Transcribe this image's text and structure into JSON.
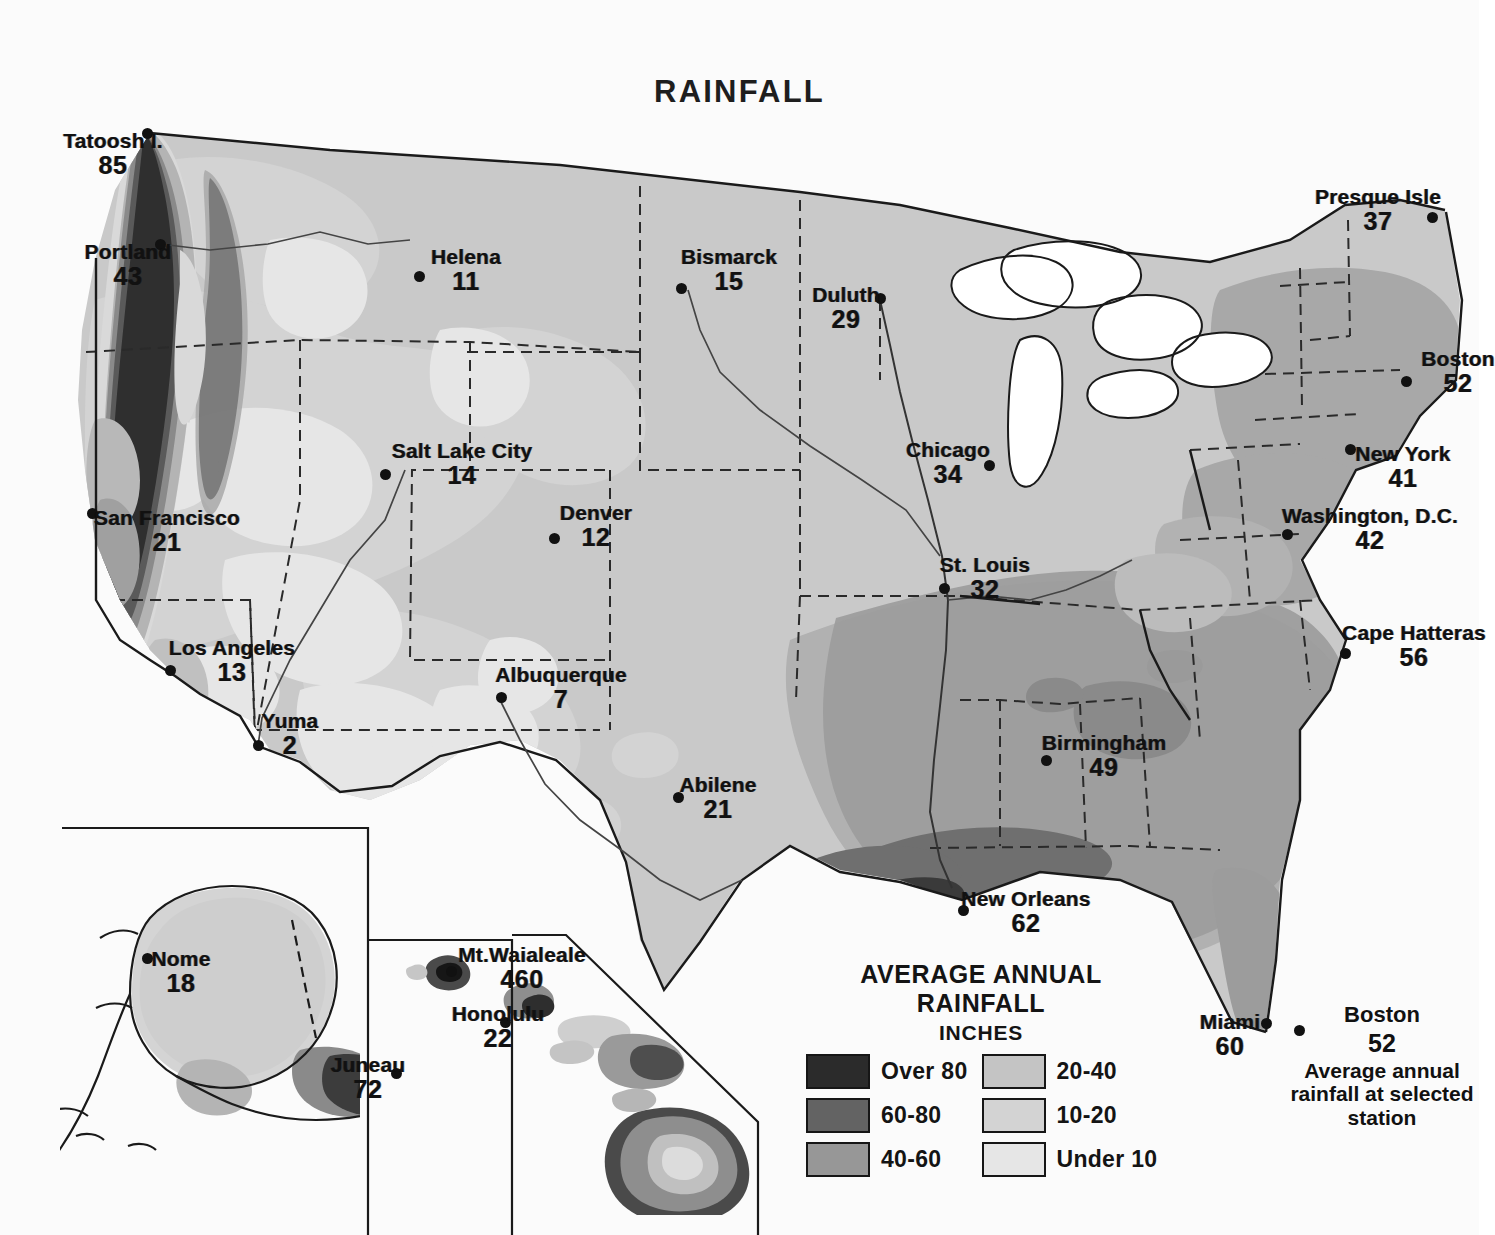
{
  "title": "RAINFALL",
  "map": {
    "name": "average-annual-rainfall-united-states",
    "land_tone": "#c9c9c9"
  },
  "legend": {
    "title": "AVERAGE ANNUAL RAINFALL",
    "subtitle": "INCHES",
    "items": [
      {
        "label": "Over 80",
        "color": "#2b2b2b"
      },
      {
        "label": "20-40",
        "color": "#c4c4c4"
      },
      {
        "label": "60-80",
        "color": "#636363"
      },
      {
        "label": "10-20",
        "color": "#d3d3d3"
      },
      {
        "label": "40-60",
        "color": "#979797"
      },
      {
        "label": "Under 10",
        "color": "#e6e6e6"
      }
    ]
  },
  "key_note": {
    "city": "Boston",
    "value": "52",
    "description": "Average annual rainfall at selected station"
  },
  "chart_data": {
    "type": "map",
    "title": "RAINFALL",
    "subtitle": "AVERAGE ANNUAL RAINFALL",
    "units": "INCHES",
    "measure": "average annual rainfall at selected station",
    "legend_bands": [
      {
        "label": "Over 80",
        "min": 80,
        "max": null,
        "color": "#2b2b2b"
      },
      {
        "label": "60-80",
        "min": 60,
        "max": 80,
        "color": "#636363"
      },
      {
        "label": "40-60",
        "min": 40,
        "max": 60,
        "color": "#979797"
      },
      {
        "label": "20-40",
        "min": 20,
        "max": 40,
        "color": "#c4c4c4"
      },
      {
        "label": "10-20",
        "min": 10,
        "max": 20,
        "color": "#d3d3d3"
      },
      {
        "label": "Under 10",
        "min": null,
        "max": 10,
        "color": "#e6e6e6"
      }
    ],
    "stations": [
      {
        "name": "Tatoosh I.",
        "value": 85,
        "x": 147,
        "y": 133,
        "lx": 113,
        "ly": 142,
        "align": "center"
      },
      {
        "name": "Portland",
        "value": 43,
        "x": 160,
        "y": 244,
        "lx": 128,
        "ly": 253,
        "align": "center"
      },
      {
        "name": "Helena",
        "value": 11,
        "x": 419,
        "y": 276,
        "lx": 466,
        "ly": 258,
        "align": "center"
      },
      {
        "name": "Bismarck",
        "value": 15,
        "x": 681,
        "y": 288,
        "lx": 729,
        "ly": 258,
        "align": "center"
      },
      {
        "name": "Duluth",
        "value": 29,
        "x": 880,
        "y": 298,
        "lx": 846,
        "ly": 296,
        "align": "center"
      },
      {
        "name": "Presque Isle",
        "value": 37,
        "x": 1432,
        "y": 217,
        "lx": 1378,
        "ly": 198,
        "align": "center"
      },
      {
        "name": "Boston",
        "value": 52,
        "x": 1406,
        "y": 381,
        "lx": 1458,
        "ly": 360,
        "align": "center"
      },
      {
        "name": "New York",
        "value": 41,
        "x": 1350,
        "y": 449,
        "lx": 1403,
        "ly": 455,
        "align": "center"
      },
      {
        "name": "Washington, D.C.",
        "value": 42,
        "x": 1287,
        "y": 534,
        "lx": 1370,
        "ly": 517,
        "align": "center"
      },
      {
        "name": "Cape Hatteras",
        "value": 56,
        "x": 1345,
        "y": 653,
        "lx": 1414,
        "ly": 634,
        "align": "center"
      },
      {
        "name": "Chicago",
        "value": 34,
        "x": 989,
        "y": 465,
        "lx": 948,
        "ly": 451,
        "align": "center"
      },
      {
        "name": "St. Louis",
        "value": 32,
        "x": 944,
        "y": 588,
        "lx": 985,
        "ly": 566,
        "align": "center"
      },
      {
        "name": "Salt Lake City",
        "value": 14,
        "x": 385,
        "y": 474,
        "lx": 462,
        "ly": 452,
        "align": "center"
      },
      {
        "name": "Denver",
        "value": 12,
        "x": 554,
        "y": 538,
        "lx": 596,
        "ly": 514,
        "align": "center"
      },
      {
        "name": "San Francisco",
        "value": 21,
        "x": 92,
        "y": 513,
        "lx": 167,
        "ly": 519,
        "align": "center"
      },
      {
        "name": "Los Angeles",
        "value": 13,
        "x": 170,
        "y": 670,
        "lx": 232,
        "ly": 649,
        "align": "center"
      },
      {
        "name": "Yuma",
        "value": 2,
        "x": 258,
        "y": 745,
        "lx": 290,
        "ly": 722,
        "align": "center"
      },
      {
        "name": "Albuquerque",
        "value": 7,
        "x": 501,
        "y": 697,
        "lx": 561,
        "ly": 676,
        "align": "center"
      },
      {
        "name": "Abilene",
        "value": 21,
        "x": 678,
        "y": 797,
        "lx": 718,
        "ly": 786,
        "align": "center"
      },
      {
        "name": "Birmingham",
        "value": 49,
        "x": 1046,
        "y": 760,
        "lx": 1104,
        "ly": 744,
        "align": "center"
      },
      {
        "name": "New Orleans",
        "value": 62,
        "x": 963,
        "y": 910,
        "lx": 1026,
        "ly": 900,
        "align": "center"
      },
      {
        "name": "Miami",
        "value": 60,
        "x": 1266,
        "y": 1023,
        "lx": 1230,
        "ly": 1023,
        "align": "center"
      },
      {
        "name": "Nome",
        "value": 18,
        "x": 147,
        "y": 958,
        "lx": 181,
        "ly": 960,
        "align": "center"
      },
      {
        "name": "Juneau",
        "value": 72,
        "x": 396,
        "y": 1073,
        "lx": 368,
        "ly": 1066,
        "align": "center"
      },
      {
        "name": "Mt.Waialeale",
        "value": 460,
        "x": 451,
        "y": 971,
        "lx": 522,
        "ly": 956,
        "align": "center"
      },
      {
        "name": "Honolulu",
        "value": 22,
        "x": 505,
        "y": 1022,
        "lx": 498,
        "ly": 1015,
        "align": "center"
      }
    ],
    "insets": [
      "Alaska",
      "Hawaii"
    ]
  }
}
